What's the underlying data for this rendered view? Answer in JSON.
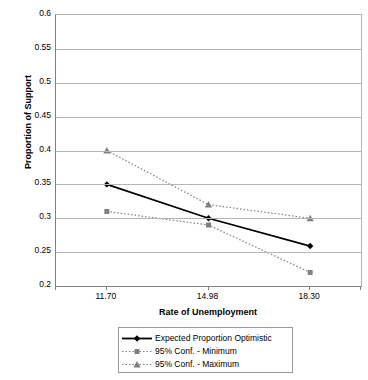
{
  "chart_data": {
    "type": "line",
    "title": "",
    "xlabel": "Rate of Unemployment",
    "ylabel": "Proportion of Support",
    "categories": [
      "11.70",
      "14.98",
      "18.30"
    ],
    "x_tick_labels": [
      "11.70",
      "14.98",
      "18.30"
    ],
    "y_tick_labels": [
      "0.6",
      "0.55",
      "0.5",
      "0.45",
      "0.4",
      "0.35",
      "0.3",
      "0.25",
      "0.2"
    ],
    "y_tick_values": [
      0.6,
      0.55,
      0.5,
      0.45,
      0.4,
      0.35,
      0.3,
      0.25,
      0.2
    ],
    "ylim": [
      0.2,
      0.6
    ],
    "grid": true,
    "legend_position": "bottom",
    "series": [
      {
        "name": "Expected Proportion Optimistic",
        "values": [
          0.35,
          0.3,
          0.259
        ],
        "marker": "diamond",
        "line_style": "solid",
        "color": "#000000"
      },
      {
        "name": "95% Conf. - Minimum",
        "values": [
          0.31,
          0.29,
          0.22
        ],
        "marker": "square",
        "line_style": "dotted",
        "color": "#808080"
      },
      {
        "name": "95% Conf. - Maximum",
        "values": [
          0.4,
          0.32,
          0.3
        ],
        "marker": "triangle",
        "line_style": "dotted",
        "color": "#808080"
      }
    ]
  },
  "legend": {
    "entries": [
      {
        "label": "Expected Proportion Optimistic"
      },
      {
        "label": "95% Conf. - Minimum"
      },
      {
        "label": "95% Conf. - Maximum"
      }
    ]
  },
  "colors": {
    "series_primary": "#000000",
    "series_confidence": "#808080",
    "gridline": "#b5b5b5",
    "axis": "#808080",
    "background": "#ffffff"
  }
}
